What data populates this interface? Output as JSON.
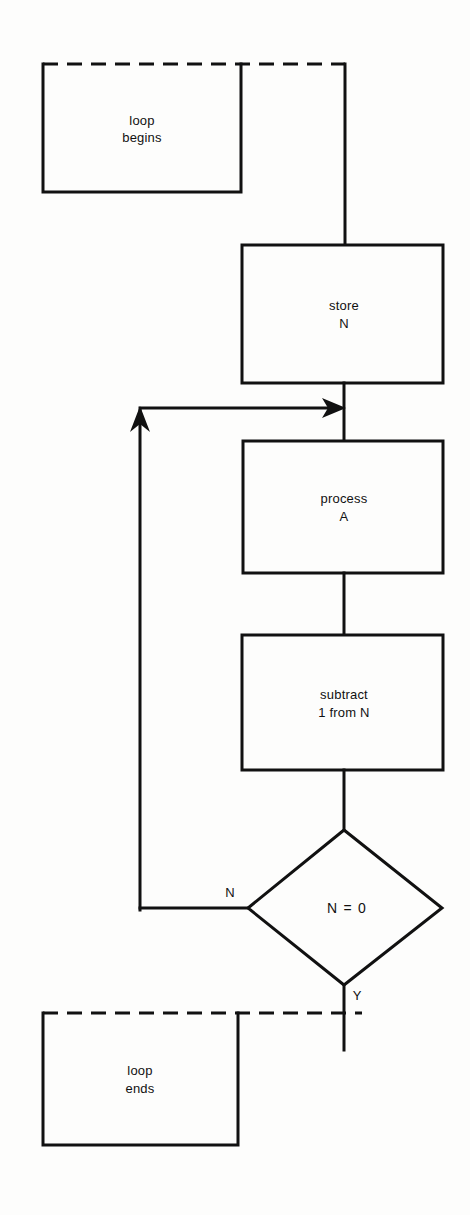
{
  "diagram": {
    "background_color": "#fdfdfc",
    "line_color": "#111111",
    "nodes": {
      "loop_begins": {
        "label_line1": "loop",
        "label_line2": "begins",
        "shape": "open-box-dashed-top"
      },
      "store_n": {
        "label_line1": "store",
        "label_line2": "N",
        "shape": "process-box"
      },
      "process_a": {
        "label_line1": "process",
        "label_line2": "A",
        "shape": "process-box"
      },
      "subtract": {
        "label_line1": "subtract",
        "label_line2": "1 from N",
        "shape": "process-box"
      },
      "decision": {
        "label": "N = 0",
        "shape": "diamond"
      },
      "loop_ends": {
        "label_line1": "loop",
        "label_line2": "ends",
        "shape": "open-box-dashed-top"
      }
    },
    "branch_labels": {
      "no": "N",
      "yes": "Y"
    }
  }
}
